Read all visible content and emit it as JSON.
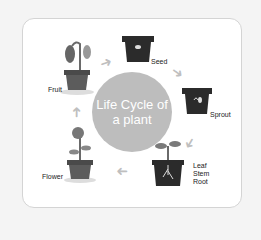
{
  "title_line1": "Life Cycle of",
  "title_line2": "a plant",
  "stages": {
    "seed": "Seed",
    "sprout": "Sprout",
    "leaf": "Leaf",
    "stem": "Stem",
    "root": "Root",
    "flower": "Flower",
    "fruit": "Fruit"
  },
  "colors": {
    "circle": "#bdbdbd",
    "pot_dark": "#2b2b2b",
    "pot_grey": "#5c5c5c",
    "arrow": "#bfbfbf"
  }
}
